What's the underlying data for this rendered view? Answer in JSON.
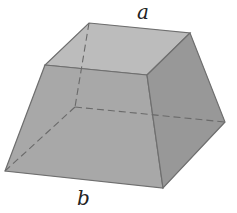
{
  "diagram": {
    "type": "frustum-square-pyramid",
    "labels": {
      "top_edge": "a",
      "bottom_edge": "b"
    },
    "colors": {
      "top_face": "#b8b8b8",
      "front_face": "#a6a6a6",
      "right_face": "#969696",
      "edge": "#6f6f6f",
      "hidden_edge": "#7a7a7a",
      "label": "#222222"
    }
  }
}
